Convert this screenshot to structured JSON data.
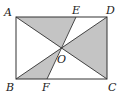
{
  "diagram": {
    "type": "geometry",
    "colors": {
      "stroke": "#333333",
      "shade": "#c4c4c4",
      "background": "#ffffff"
    },
    "points": {
      "A": {
        "label": "A",
        "x": 16,
        "y": 17
      },
      "D": {
        "label": "D",
        "x": 107,
        "y": 17
      },
      "B": {
        "label": "B",
        "x": 16,
        "y": 79
      },
      "C": {
        "label": "C",
        "x": 107,
        "y": 79
      },
      "E": {
        "label": "E",
        "x": 76,
        "y": 17
      },
      "F": {
        "label": "F",
        "x": 47,
        "y": 79
      },
      "O": {
        "label": "O",
        "x": 61,
        "y": 48
      }
    },
    "segments": [
      "AB",
      "BC",
      "CD",
      "DA",
      "AC",
      "BD",
      "EF"
    ],
    "shaded_regions": [
      "AOE",
      "BOF",
      "DOC"
    ]
  }
}
